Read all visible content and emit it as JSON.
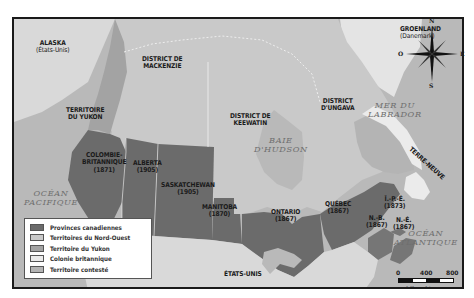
{
  "map": {
    "colors": {
      "provinces": "#6b6b6b",
      "northwest_territories": "#c9c9c9",
      "yukon": "#a3a3a3",
      "british_colony": "#ebebeb",
      "disputed": "#b4b4b4",
      "water": "#b9b9b9",
      "foreign_land": "#d9d9d9"
    },
    "foreign_labels": {
      "alaska": "ALASKA",
      "alaska_sub": "(États-Unis)",
      "greenland": "GROENLAND",
      "greenland_sub": "(Danemark)",
      "usa": "ÉTATS-UNIS"
    },
    "regions": {
      "yukon": [
        "TERRITOIRE",
        "DU YUKON"
      ],
      "mackenzie": [
        "DISTRICT DE",
        "MACKENZIE"
      ],
      "keewatin": [
        "DISTRICT DE",
        "KEEWATIN"
      ],
      "ungava": [
        "DISTRICT",
        "D'UNGAVA"
      ],
      "bc": [
        "COLOMBIE-",
        "BRITANNIQUE",
        "(1871)"
      ],
      "alberta": [
        "ALBERTA",
        "(1905)"
      ],
      "saskatchewan": [
        "SASKATCHEWAN",
        "(1905)"
      ],
      "manitoba": [
        "MANITOBA",
        "(1870)"
      ],
      "ontario": [
        "ONTARIO",
        "(1867)"
      ],
      "quebec": [
        "QUÉBEC",
        "(1867)"
      ],
      "pei": [
        "Î.-P.-É.",
        "(1873)"
      ],
      "nb": [
        "N.-B.",
        "(1867)"
      ],
      "ns": [
        "N.-É.",
        "(1867)"
      ],
      "newfoundland": "TERRE-NEUVE"
    },
    "water_labels": {
      "pacific": [
        "OCÉAN",
        "PACIFIQUE"
      ],
      "atlantic": [
        "OCÉAN",
        "ATLANTIQUE"
      ],
      "hudson": [
        "BAIE",
        "D'HUDSON"
      ],
      "labrador": [
        "MER DU",
        "LABRADOR"
      ]
    },
    "compass": {
      "n": "N",
      "s": "S",
      "e": "E",
      "o": "O"
    },
    "scale": {
      "ticks": [
        "0",
        "400",
        "800"
      ],
      "unit": "kilomètres"
    },
    "legend": [
      {
        "label": "Provinces canadiennes",
        "color": "#6b6b6b"
      },
      {
        "label": "Territoires du Nord-Ouest",
        "color": "#c9c9c9"
      },
      {
        "label": "Territoire du Yukon",
        "color": "#a3a3a3"
      },
      {
        "label": "Colonie britannique",
        "color": "#ebebeb"
      },
      {
        "label": "Territoire contesté",
        "color": "#b4b4b4"
      }
    ]
  }
}
